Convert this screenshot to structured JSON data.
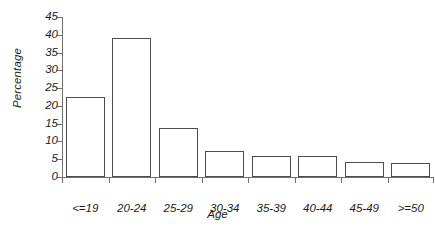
{
  "chart_data": {
    "type": "bar",
    "title": "",
    "xlabel": "Age",
    "ylabel": "Percentage",
    "categories": [
      "<=19",
      "20-24",
      "25-29",
      "30-34",
      "35-39",
      "40-44",
      "45-49",
      ">=50"
    ],
    "values": [
      22.5,
      39,
      13.7,
      7.3,
      6,
      6,
      4.2,
      4
    ],
    "ylim": [
      0,
      45
    ],
    "yticks": [
      0,
      5,
      10,
      15,
      20,
      25,
      30,
      35,
      40,
      45
    ],
    "ytick_labels": [
      "0",
      "5",
      "10",
      "15",
      "20",
      "25",
      "30",
      "35",
      "40",
      "45"
    ],
    "grid": false,
    "legend": null,
    "bar_style": {
      "fill": "#ffffff",
      "edge": "#4d4d4d"
    },
    "axis_color": "#6f6f6f"
  }
}
